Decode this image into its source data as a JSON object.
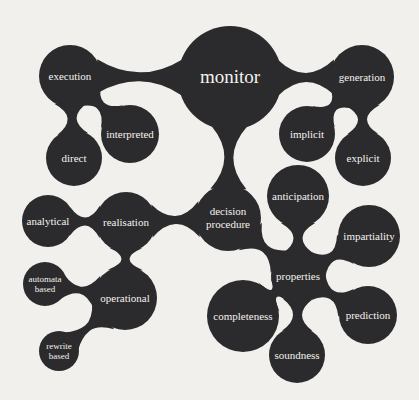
{
  "diagram": {
    "type": "bubble-mind-map",
    "colors": {
      "background": "#f1f0ec",
      "node": "#2b2a2c",
      "text": "#f4f2ee"
    },
    "nodes": [
      {
        "id": "monitor",
        "label": [
          "monitor"
        ],
        "x": 230,
        "y": 78,
        "r": 52,
        "fs": 19
      },
      {
        "id": "execution",
        "label": [
          "execution"
        ],
        "x": 70,
        "y": 76,
        "r": 31,
        "fs": 11
      },
      {
        "id": "interpreted",
        "label": [
          "interpreted"
        ],
        "x": 130,
        "y": 134,
        "r": 29,
        "fs": 11
      },
      {
        "id": "direct",
        "label": [
          "direct"
        ],
        "x": 74,
        "y": 158,
        "r": 28,
        "fs": 11
      },
      {
        "id": "generation",
        "label": [
          "generation"
        ],
        "x": 362,
        "y": 77,
        "r": 32,
        "fs": 11
      },
      {
        "id": "implicit",
        "label": [
          "implicit"
        ],
        "x": 307,
        "y": 134,
        "r": 28,
        "fs": 11
      },
      {
        "id": "explicit",
        "label": [
          "explicit"
        ],
        "x": 363,
        "y": 158,
        "r": 28,
        "fs": 11
      },
      {
        "id": "decision-procedure",
        "label": [
          "decision",
          "procedure"
        ],
        "x": 228,
        "y": 218,
        "r": 33,
        "fs": 11
      },
      {
        "id": "anticipation",
        "label": [
          "anticipation"
        ],
        "x": 298,
        "y": 196,
        "r": 31,
        "fs": 11
      },
      {
        "id": "impartiality",
        "label": [
          "impartiality"
        ],
        "x": 369,
        "y": 236,
        "r": 31,
        "fs": 11
      },
      {
        "id": "properties",
        "label": [
          "properties"
        ],
        "x": 298,
        "y": 276,
        "r": 27,
        "fs": 11
      },
      {
        "id": "completeness",
        "label": [
          "completeness"
        ],
        "x": 243,
        "y": 316,
        "r": 36,
        "fs": 11
      },
      {
        "id": "prediction",
        "label": [
          "prediction"
        ],
        "x": 368,
        "y": 315,
        "r": 29,
        "fs": 11
      },
      {
        "id": "soundness",
        "label": [
          "soundness"
        ],
        "x": 297,
        "y": 355,
        "r": 28,
        "fs": 11
      },
      {
        "id": "realisation",
        "label": [
          "realisation"
        ],
        "x": 126,
        "y": 222,
        "r": 30,
        "fs": 11
      },
      {
        "id": "analytical",
        "label": [
          "analytical"
        ],
        "x": 48,
        "y": 221,
        "r": 26,
        "fs": 11
      },
      {
        "id": "operational",
        "label": [
          "operational"
        ],
        "x": 125,
        "y": 298,
        "r": 32,
        "fs": 11
      },
      {
        "id": "automata-based",
        "label": [
          "automata",
          "based"
        ],
        "x": 45,
        "y": 284,
        "r": 22,
        "fs": 9
      },
      {
        "id": "rewrite-based",
        "label": [
          "rewrite",
          "based"
        ],
        "x": 59,
        "y": 351,
        "r": 20,
        "fs": 9
      }
    ],
    "edges": [
      [
        "monitor",
        "execution",
        9
      ],
      [
        "execution",
        "interpreted",
        9
      ],
      [
        "execution",
        "direct",
        9
      ],
      [
        "monitor",
        "generation",
        9
      ],
      [
        "generation",
        "implicit",
        9
      ],
      [
        "generation",
        "explicit",
        9
      ],
      [
        "monitor",
        "decision-procedure",
        9
      ],
      [
        "decision-procedure",
        "realisation",
        8
      ],
      [
        "decision-procedure",
        "properties",
        8
      ],
      [
        "realisation",
        "analytical",
        8
      ],
      [
        "realisation",
        "operational",
        8
      ],
      [
        "operational",
        "automata-based",
        7
      ],
      [
        "operational",
        "rewrite-based",
        7
      ],
      [
        "properties",
        "anticipation",
        9
      ],
      [
        "properties",
        "impartiality",
        9
      ],
      [
        "properties",
        "completeness",
        9
      ],
      [
        "properties",
        "prediction",
        9
      ],
      [
        "properties",
        "soundness",
        9
      ]
    ]
  }
}
